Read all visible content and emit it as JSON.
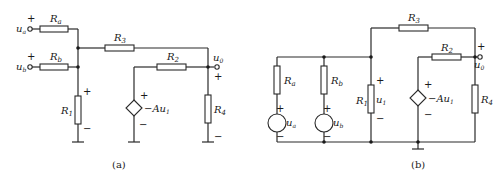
{
  "figure": {
    "panels": [
      {
        "caption": "(a)",
        "labels": {
          "Ra": "R",
          "Ra_sub": "a",
          "Rb": "R",
          "Rb_sub": "b",
          "R1": "R",
          "R1_sub": "1",
          "R2": "R",
          "R2_sub": "2",
          "R3": "R",
          "R3_sub": "3",
          "R4": "R",
          "R4_sub": "4",
          "ua": "u",
          "ua_sub": "a",
          "ub": "u",
          "ub_sub": "b",
          "u0": "u",
          "u0_sub": "0",
          "dep_source": "−Au",
          "dep_source_sub": "1",
          "plus": "+",
          "minus": "−"
        }
      },
      {
        "caption": "(b)",
        "labels": {
          "Ra": "R",
          "Ra_sub": "a",
          "Rb": "R",
          "Rb_sub": "b",
          "R1": "R",
          "R1_sub": "1",
          "R2": "R",
          "R2_sub": "2",
          "R3": "R",
          "R3_sub": "3",
          "R4": "R",
          "R4_sub": "4",
          "ua": "u",
          "ua_sub": "a",
          "ub": "u",
          "ub_sub": "b",
          "u1": "u",
          "u1_sub": "1",
          "u0": "u",
          "u0_sub": "0",
          "dep_source": "−Au",
          "dep_source_sub": "1",
          "plus": "+",
          "minus": "−"
        }
      }
    ]
  }
}
